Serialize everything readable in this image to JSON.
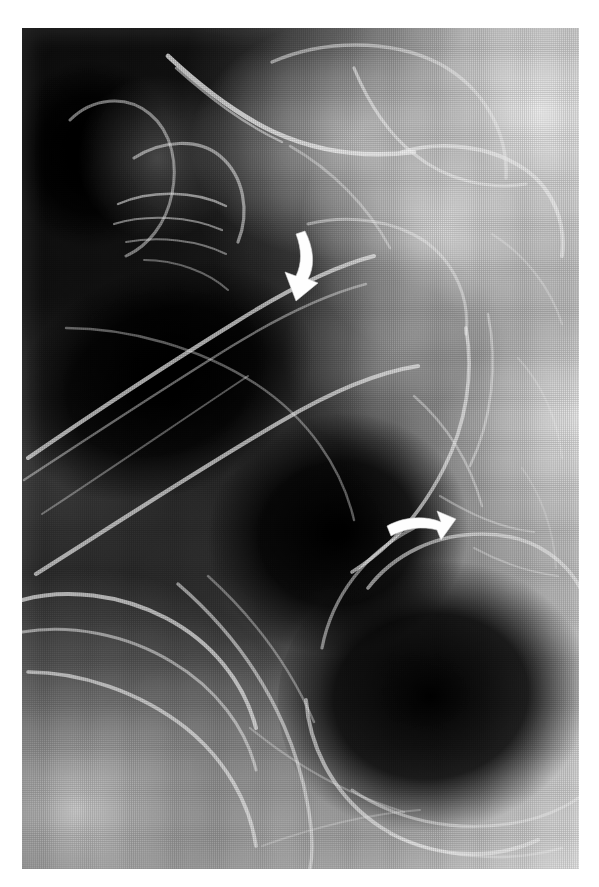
{
  "figure": {
    "kind": "radiograph",
    "modality_label": "barium-contrast-radiograph",
    "caption": "",
    "background_color": "#ffffff",
    "plate": {
      "x": 22,
      "y": 28,
      "width": 557,
      "height": 841,
      "dark_tone": "#0b0b0b",
      "bright_tone": "#f2f2f2",
      "mid_tone": "#7a7a7a",
      "texture": "halftone-print-screen"
    },
    "annotations": [
      {
        "id": "arrow-1",
        "type": "curved-arrow",
        "color": "#fefefe",
        "direction": "down",
        "points_at": "upper-bowel-loop-wall",
        "x": 285,
        "y": 230,
        "width": 32,
        "height": 70
      },
      {
        "id": "arrow-2",
        "type": "curved-arrow",
        "color": "#fefefe",
        "direction": "right",
        "points_at": "lower-bowel-loop-wall",
        "x": 385,
        "y": 505,
        "width": 72,
        "height": 42
      }
    ],
    "regions": [
      {
        "id": "upper-left-folded-loop",
        "tone": "mid",
        "description": "folded bowel loop with mucosal folds"
      },
      {
        "id": "upper-right-bright-loops",
        "tone": "bright",
        "description": "overlapping barium-filled loops"
      },
      {
        "id": "central-gas-loops",
        "tone": "dark",
        "description": "gas-filled bowel lumen"
      },
      {
        "id": "lower-right-large-loop",
        "tone": "dark",
        "description": "large distended gas-filled loop"
      },
      {
        "id": "lower-left-bright-loop",
        "tone": "bright",
        "description": "barium-coated loop wall"
      }
    ]
  }
}
